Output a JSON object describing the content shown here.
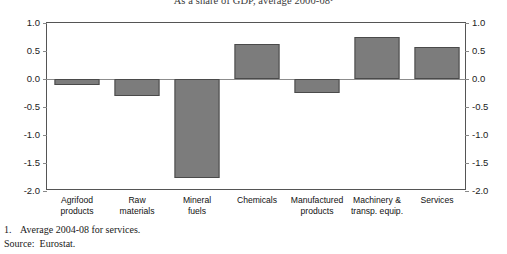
{
  "chart_data": {
    "type": "bar",
    "title": "As a share of GDP, average 2000-08¹",
    "xlabel": "",
    "ylabel": "",
    "ylim": [
      -2.0,
      1.0
    ],
    "grid": false,
    "legend": "none",
    "categories": [
      "Agrifood products",
      "Raw materials",
      "Mineral fuels",
      "Chemicals",
      "Manufactured products",
      "Machinery & transp. equip.",
      "Services"
    ],
    "values": [
      -0.1,
      -0.3,
      -1.77,
      0.62,
      -0.25,
      0.75,
      0.58
    ],
    "ytick_labels": [
      "1.0",
      "0.5",
      "0.0",
      "-0.5",
      "-1.0",
      "-1.5",
      "-2.0"
    ],
    "ytick_values": [
      1.0,
      0.5,
      0.0,
      -0.5,
      -1.0,
      -1.5,
      -2.0
    ],
    "bar_color": "#7c7c7c",
    "bar_border_color": "#4a4a4a",
    "axis_color": "#555555"
  },
  "categories_wrapped": [
    [
      "Agrifood",
      "products"
    ],
    [
      "Raw",
      "materials"
    ],
    [
      "Mineral",
      "fuels"
    ],
    [
      "Chemicals",
      ""
    ],
    [
      "Manufactured",
      "products"
    ],
    [
      "Machinery &",
      "transp. equip."
    ],
    [
      "Services",
      ""
    ]
  ],
  "footnotes": {
    "note_marker": "1.",
    "note_text": "Average 2004-08 for services.",
    "source_label": "Source:",
    "source_text": "Eurostat."
  }
}
